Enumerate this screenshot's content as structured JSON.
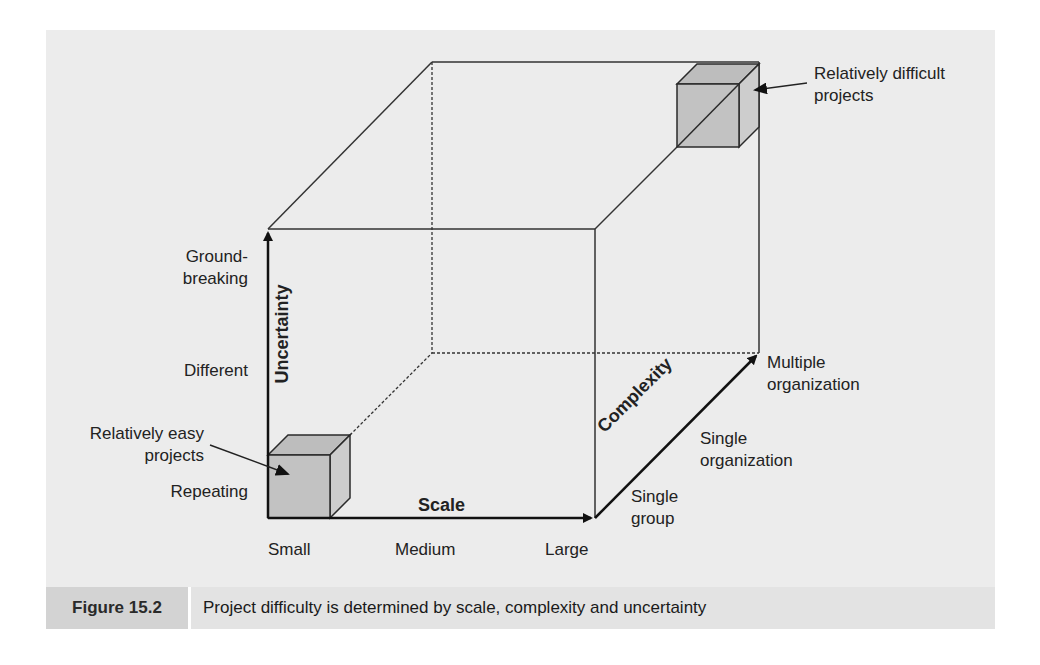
{
  "figure": {
    "number_label": "Figure 15.2",
    "caption": "Project difficulty is determined by scale, complexity and uncertainty"
  },
  "axes": {
    "uncertainty": {
      "title": "Uncertainty",
      "levels": [
        "Repeating",
        "Different",
        "Ground-breaking"
      ],
      "level_lines": {
        "groundbreaking_1": "Ground-",
        "groundbreaking_2": "breaking"
      }
    },
    "scale": {
      "title": "Scale",
      "levels": [
        "Small",
        "Medium",
        "Large"
      ]
    },
    "complexity": {
      "title": "Complexity",
      "levels": [
        "Single group",
        "Single organization",
        "Multiple organization"
      ],
      "level_lines": {
        "single_group_1": "Single",
        "single_group_2": "group",
        "single_org_1": "Single",
        "single_org_2": "organization",
        "multi_org_1": "Multiple",
        "multi_org_2": "organization"
      }
    }
  },
  "annotations": {
    "easy": {
      "line1": "Relatively easy",
      "line2": "projects"
    },
    "difficult": {
      "line1": "Relatively difficult",
      "line2": "projects"
    }
  },
  "colors": {
    "panel_bg": "#ececec",
    "caption_label_bg": "#d3d3d3",
    "caption_text_bg": "#e3e3e3",
    "cube_fill": "#c4c4c4",
    "cube_side": "#d0d0d0",
    "line": "#2a2a2a"
  }
}
